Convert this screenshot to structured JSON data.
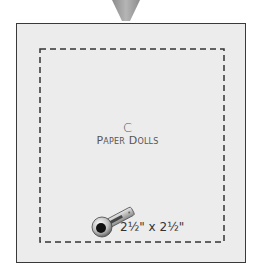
{
  "diagram": {
    "block_letter": "C",
    "block_name": "Paper Dolls",
    "cut_size": "2½\" x 2½\"",
    "icon": "rotary-cutter-icon",
    "colors": {
      "background": "#ececec",
      "border": "#3a3a3a",
      "dashed": "#333333",
      "pointer": "#9a9a9a",
      "text": "#555555"
    }
  }
}
